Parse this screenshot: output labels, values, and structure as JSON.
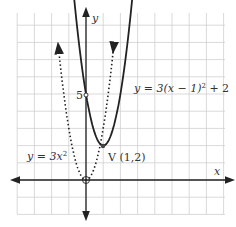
{
  "chart_data": {
    "type": "line",
    "title": "",
    "xlabel": "x",
    "ylabel": "y",
    "xlim": [
      -4,
      8
    ],
    "ylim": [
      -2,
      10
    ],
    "grid": true,
    "series": [
      {
        "name": "y = 3x^2",
        "style": "dotted",
        "expr": "3*x^2",
        "vertex": [
          0,
          0
        ]
      },
      {
        "name": "y = 3(x - 1)^2 + 2",
        "style": "solid",
        "expr": "3*(x-1)^2+2",
        "vertex": [
          1,
          2
        ]
      }
    ],
    "annotations": [
      {
        "text": "5",
        "x": 0,
        "y": 5
      },
      {
        "text": "V (1,2)",
        "x": 1,
        "y": 2
      },
      {
        "text": "y = 3(x − 1)² + 2",
        "x": 4.2,
        "y": 5.3
      },
      {
        "text": "y = 3x²",
        "x": -3.8,
        "y": 1.6
      }
    ]
  },
  "labels": {
    "y_axis": "y",
    "x_axis": "x",
    "five": "5",
    "vertex": "V (1,2)",
    "eq_shifted_pre": "y = 3(x − 1)",
    "eq_shifted_sup": "2",
    "eq_shifted_post": " + 2",
    "eq_base_pre": "y = 3x",
    "eq_base_sup": "2"
  }
}
